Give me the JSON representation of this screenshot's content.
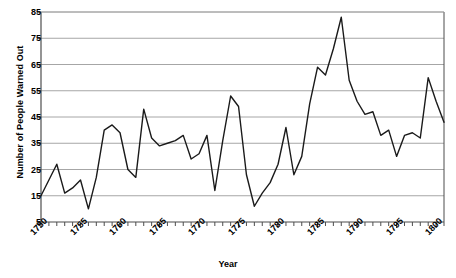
{
  "chart_data": {
    "type": "line",
    "title": "",
    "xlabel": "Year",
    "ylabel": "Number of People Warned Out",
    "xlim": [
      1750,
      1801
    ],
    "ylim": [
      5,
      85
    ],
    "ytick_values": [
      5,
      15,
      25,
      35,
      45,
      55,
      65,
      75,
      85
    ],
    "ytick_labels": [
      "5",
      "15",
      "25",
      "35",
      "45",
      "55",
      "65",
      "75",
      "85"
    ],
    "xtick_labels": [
      "1750",
      "1755",
      "1760",
      "1765",
      "1770",
      "1775",
      "1780",
      "1785",
      "1790",
      "1795",
      "1800"
    ],
    "xtick_values": [
      1750,
      1755,
      1760,
      1765,
      1770,
      1775,
      1780,
      1785,
      1790,
      1795,
      1800
    ],
    "minor_xticks_every": 1,
    "grid": "horizontal",
    "legend": "none",
    "line_color": "#1a1a1a",
    "grid_color": "#a6a6a6",
    "axis_color": "#4d4d4d",
    "background": "#ffffff",
    "x": [
      1750,
      1751,
      1752,
      1753,
      1754,
      1755,
      1756,
      1757,
      1758,
      1759,
      1760,
      1761,
      1762,
      1763,
      1764,
      1765,
      1766,
      1767,
      1768,
      1769,
      1770,
      1771,
      1772,
      1773,
      1774,
      1775,
      1776,
      1777,
      1778,
      1779,
      1780,
      1781,
      1782,
      1783,
      1784,
      1785,
      1786,
      1787,
      1788,
      1789,
      1790,
      1791,
      1792,
      1793,
      1794,
      1795,
      1796,
      1797,
      1798,
      1799,
      1800,
      1801
    ],
    "values": [
      15,
      21,
      27,
      16,
      18,
      21,
      10,
      22,
      40,
      42,
      39,
      25,
      22,
      48,
      37,
      34,
      35,
      36,
      38,
      29,
      31,
      38,
      17,
      36,
      53,
      49,
      23,
      11,
      16,
      20,
      27,
      41,
      23,
      30,
      50,
      64,
      61,
      71,
      83,
      59,
      51,
      46,
      47,
      38,
      40,
      30,
      38,
      39,
      37,
      60,
      51,
      43
    ]
  }
}
